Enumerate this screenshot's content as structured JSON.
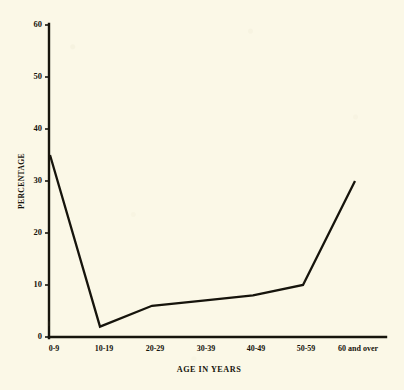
{
  "chart_data": {
    "type": "line",
    "title": "",
    "subtitle": "",
    "xlabel": "AGE IN YEARS",
    "ylabel": "PERCENTAGE",
    "categories": [
      "0-9",
      "10-19",
      "20-29",
      "30-39",
      "40-49",
      "50-59",
      "60 and over"
    ],
    "values": [
      35,
      2,
      6,
      7,
      8,
      10,
      30
    ],
    "series": [
      {
        "name": "Percentage by age group",
        "values": [
          35,
          2,
          6,
          7,
          8,
          10,
          30
        ]
      }
    ],
    "ylim": [
      0,
      60
    ],
    "y_ticks": [
      0,
      10,
      20,
      30,
      40,
      50,
      60
    ],
    "y_tick_labels": [
      "0",
      "10",
      "20",
      "30",
      "40",
      "50",
      "60"
    ],
    "x_tick_labels": [
      "0-9",
      "10-19",
      "20-29",
      "30-39",
      "40-49",
      "50-59",
      "60 and over"
    ],
    "grid": false,
    "legend": false,
    "legend_position": "none",
    "line_color": "#16140c",
    "axis_color": "#17150d",
    "background_color": "#fbf8e7"
  }
}
